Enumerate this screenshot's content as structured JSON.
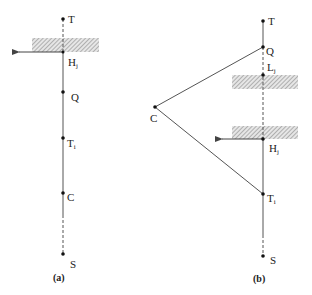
{
  "panels": [
    {
      "caption": "(a)",
      "labels": {
        "T": "T",
        "H": "H",
        "H_sub": "j",
        "Q": "Q",
        "Ti": "T",
        "Ti_sub": "i",
        "C": "C",
        "S": "S"
      }
    },
    {
      "caption": "(b)",
      "labels": {
        "T": "T",
        "Q": "Q",
        "L": "L",
        "L_sub": "j",
        "C": "C",
        "H": "H",
        "H_sub": "j",
        "Ti": "T",
        "Ti_sub": "i",
        "S": "S"
      }
    }
  ],
  "colors": {
    "line": "#555555",
    "point": "#111111",
    "hatch": "#9a9a9a"
  }
}
